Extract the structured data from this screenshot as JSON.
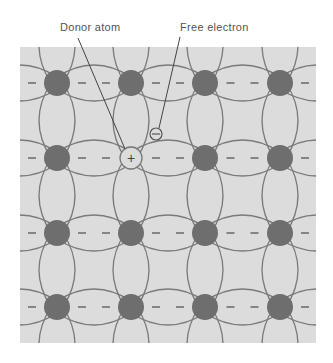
{
  "labels": {
    "donor": "Donor atom",
    "electron": "Free electron"
  },
  "symbols": {
    "negative": "−",
    "positive": "+",
    "electron": "−"
  },
  "colors": {
    "panel": "#dcdcdc",
    "atom": "#6e6e6e",
    "bond": "#7a7a7a",
    "text": "#555555"
  },
  "lattice": {
    "columns": [
      57,
      131,
      205,
      280
    ],
    "rows": [
      83,
      158,
      233,
      307
    ],
    "donor_position": {
      "col": 1,
      "row": 1
    }
  }
}
